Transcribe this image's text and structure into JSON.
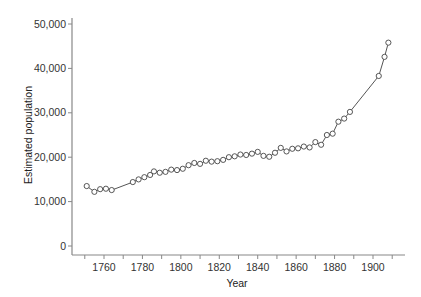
{
  "chart_data": {
    "type": "line",
    "title": "",
    "xlabel": "Year",
    "ylabel": "Estimated population",
    "xlim": [
      1746,
      1914
    ],
    "ylim": [
      -1500,
      52000
    ],
    "grid": false,
    "legend": null,
    "marker": "open-circle",
    "x_ticks": [
      1760,
      1780,
      1800,
      1820,
      1840,
      1860,
      1880,
      1900
    ],
    "x_minor_ticks": [
      1750,
      1770,
      1790,
      1810,
      1830,
      1850,
      1870,
      1890,
      1910
    ],
    "y_ticks": [
      0,
      10000,
      20000,
      30000,
      40000,
      50000
    ],
    "y_tick_labels": [
      "0",
      "10,000",
      "20,000",
      "30,000",
      "40,000",
      "50,000"
    ],
    "series": [
      {
        "name": "Estimated population",
        "x": [
          1751,
          1755,
          1758,
          1761,
          1764,
          1775,
          1778,
          1781,
          1784,
          1786,
          1789,
          1792,
          1795,
          1798,
          1801,
          1804,
          1807,
          1810,
          1813,
          1816,
          1819,
          1822,
          1825,
          1828,
          1831,
          1834,
          1837,
          1840,
          1843,
          1846,
          1849,
          1852,
          1855,
          1858,
          1861,
          1864,
          1867,
          1870,
          1873,
          1876,
          1879,
          1882,
          1885,
          1888,
          1903,
          1906,
          1908
        ],
        "values": [
          13500,
          12200,
          12800,
          12900,
          12600,
          14400,
          15000,
          15500,
          16000,
          16800,
          16500,
          16700,
          17200,
          17100,
          17400,
          18200,
          18700,
          18500,
          19200,
          19000,
          19100,
          19400,
          20000,
          20200,
          20600,
          20500,
          20800,
          21200,
          20300,
          20100,
          21000,
          22100,
          21300,
          21900,
          22000,
          22400,
          22200,
          23400,
          22800,
          25000,
          25300,
          28000,
          28700,
          30200,
          38300,
          42600,
          45800
        ]
      }
    ]
  },
  "colors": {
    "axis": "#888888",
    "line": "#555555",
    "marker_stroke": "#444444",
    "marker_fill": "#ffffff",
    "text": "#333333"
  }
}
